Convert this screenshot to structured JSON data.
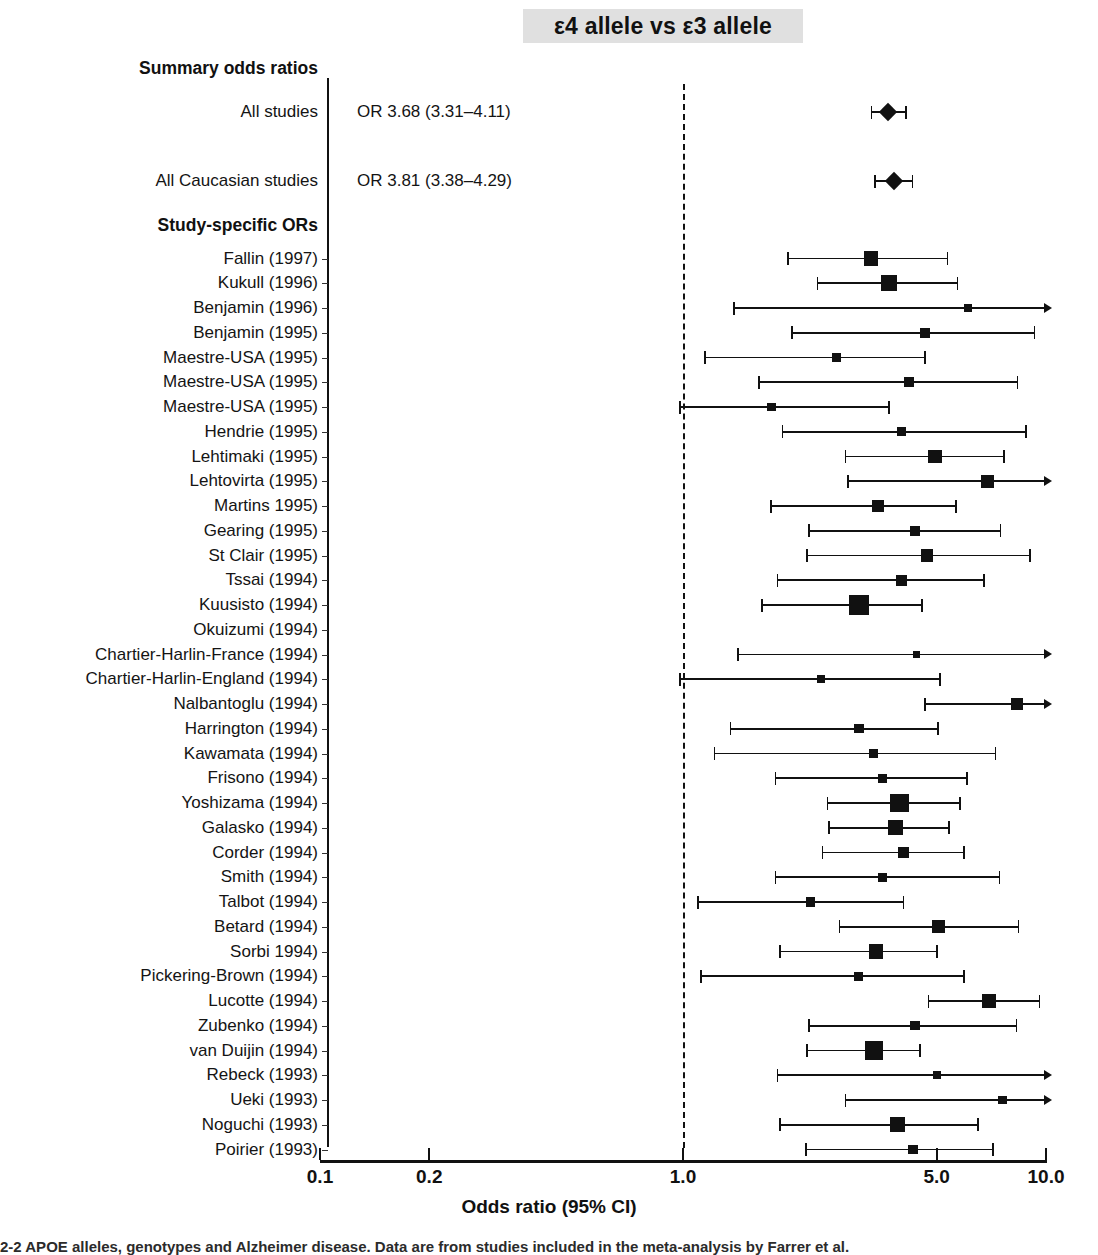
{
  "chart_data": {
    "type": "forest",
    "title": "ε4 allele vs ε3 allele",
    "xlabel": "Odds ratio (95% CI)",
    "ylabel": "",
    "xscale": "log",
    "xlim": [
      0.1,
      10.0
    ],
    "xticks": [
      "0.1",
      "0.2",
      "1.0",
      "5.0",
      "10.0"
    ],
    "xtick_values": [
      0.1,
      0.2,
      1.0,
      5.0,
      10.0
    ],
    "null_line": 1.0,
    "grid": false,
    "legend": "none",
    "sections": [
      {
        "heading": "Summary odds ratios",
        "marker": "diamond",
        "rows": [
          {
            "label": "All studies",
            "or_text": "OR 3.68 (3.31–4.11)",
            "or": 3.68,
            "lcl": 3.31,
            "ucl": 4.11,
            "weight": 1.0
          },
          {
            "label": "All Caucasian studies",
            "or_text": "OR 3.81 (3.38–4.29)",
            "or": 3.81,
            "lcl": 3.38,
            "ucl": 4.29,
            "weight": 1.0
          }
        ]
      },
      {
        "heading": "Study-specific ORs",
        "marker": "square",
        "rows": [
          {
            "label": "Fallin (1997)",
            "or": 3.3,
            "lcl": 1.95,
            "ucl": 5.35,
            "weight": 0.38
          },
          {
            "label": "Kukull (1996)",
            "or": 3.7,
            "lcl": 2.35,
            "ucl": 5.7,
            "weight": 0.52
          },
          {
            "label": "Benjamin (1996)",
            "or": 6.1,
            "lcl": 1.38,
            "ucl": 10.0,
            "weight": 0.07
          },
          {
            "label": "Benjamin (1995)",
            "or": 4.65,
            "lcl": 2.0,
            "ucl": 9.3,
            "weight": 0.14
          },
          {
            "label": "Maestre-USA (1995)",
            "or": 2.65,
            "lcl": 1.15,
            "ucl": 4.65,
            "weight": 0.13
          },
          {
            "label": "Maestre-USA (1995)",
            "or": 4.2,
            "lcl": 1.62,
            "ucl": 8.35,
            "weight": 0.16
          },
          {
            "label": "Maestre-USA (1995)",
            "or": 1.75,
            "lcl": 0.98,
            "ucl": 3.7,
            "weight": 0.11
          },
          {
            "label": "Hendrie (1995)",
            "or": 4.0,
            "lcl": 1.88,
            "ucl": 8.8,
            "weight": 0.1
          },
          {
            "label": "Lehtimaki (1995)",
            "or": 4.95,
            "lcl": 2.8,
            "ucl": 7.65,
            "weight": 0.34
          },
          {
            "label": "Lehtovirta (1995)",
            "or": 6.9,
            "lcl": 2.85,
            "ucl": 10.0,
            "weight": 0.3
          },
          {
            "label": "Martins 1995)",
            "or": 3.45,
            "lcl": 1.75,
            "ucl": 5.65,
            "weight": 0.27
          },
          {
            "label": "Gearing (1995)",
            "or": 4.35,
            "lcl": 2.22,
            "ucl": 7.5,
            "weight": 0.15
          },
          {
            "label": "St Clair (1995)",
            "or": 4.7,
            "lcl": 2.2,
            "ucl": 9.05,
            "weight": 0.26
          },
          {
            "label": "Tssai (1994)",
            "or": 4.0,
            "lcl": 1.82,
            "ucl": 6.75,
            "weight": 0.19
          },
          {
            "label": "Kuusisto (1994)",
            "or": 3.05,
            "lcl": 1.65,
            "ucl": 4.55,
            "weight": 0.95
          },
          {
            "label": "Okuizumi (1994)",
            "or": null,
            "lcl": null,
            "ucl": null,
            "weight": 0
          },
          {
            "label": "Chartier-Harlin-France (1994)",
            "or": 4.4,
            "lcl": 1.42,
            "ucl": 10.0,
            "weight": 0.07
          },
          {
            "label": "Chartier-Harlin-England (1994)",
            "or": 2.4,
            "lcl": 0.98,
            "ucl": 5.1,
            "weight": 0.09
          },
          {
            "label": "Nalbantoglu (1994)",
            "or": 8.3,
            "lcl": 4.65,
            "ucl": 10.0,
            "weight": 0.24
          },
          {
            "label": "Harrington (1994)",
            "or": 3.05,
            "lcl": 1.35,
            "ucl": 5.05,
            "weight": 0.13
          },
          {
            "label": "Kawamata (1994)",
            "or": 3.35,
            "lcl": 1.22,
            "ucl": 7.25,
            "weight": 0.1
          },
          {
            "label": "Frisono (1994)",
            "or": 3.55,
            "lcl": 1.8,
            "ucl": 6.05,
            "weight": 0.13
          },
          {
            "label": "Yoshizama (1994)",
            "or": 3.95,
            "lcl": 2.5,
            "ucl": 5.8,
            "weight": 0.72
          },
          {
            "label": "Galasko (1994)",
            "or": 3.85,
            "lcl": 2.52,
            "ucl": 5.4,
            "weight": 0.44
          },
          {
            "label": "Corder (1994)",
            "or": 4.05,
            "lcl": 2.42,
            "ucl": 5.95,
            "weight": 0.22
          },
          {
            "label": "Smith (1994)",
            "or": 3.55,
            "lcl": 1.8,
            "ucl": 7.45,
            "weight": 0.12
          },
          {
            "label": "Talbot (1994)",
            "or": 2.25,
            "lcl": 1.1,
            "ucl": 4.05,
            "weight": 0.12
          },
          {
            "label": "Betard (1994)",
            "or": 5.05,
            "lcl": 2.7,
            "ucl": 8.4,
            "weight": 0.32
          },
          {
            "label": "Sorbi 1994)",
            "or": 3.4,
            "lcl": 1.85,
            "ucl": 5.0,
            "weight": 0.38
          },
          {
            "label": "Pickering-Brown (1994)",
            "or": 3.05,
            "lcl": 1.12,
            "ucl": 5.95,
            "weight": 0.1
          },
          {
            "label": "Lucotte (1994)",
            "or": 6.95,
            "lcl": 4.75,
            "ucl": 9.6,
            "weight": 0.38
          },
          {
            "label": "Zubenko (1994)",
            "or": 4.35,
            "lcl": 2.22,
            "ucl": 8.3,
            "weight": 0.13
          },
          {
            "label": "van Duijin (1994)",
            "or": 3.35,
            "lcl": 2.2,
            "ucl": 4.5,
            "weight": 0.7
          },
          {
            "label": "Rebeck (1993)",
            "or": 5.0,
            "lcl": 1.82,
            "ucl": 10.0,
            "weight": 0.09
          },
          {
            "label": "Ueki (1993)",
            "or": 7.6,
            "lcl": 2.8,
            "ucl": 10.0,
            "weight": 0.1
          },
          {
            "label": "Noguchi (1993)",
            "or": 3.9,
            "lcl": 1.85,
            "ucl": 6.5,
            "weight": 0.42
          },
          {
            "label": "Poirier (1993)",
            "or": 4.3,
            "lcl": 2.18,
            "ucl": 7.15,
            "weight": 0.13
          }
        ]
      }
    ]
  },
  "colors": {
    "marker": "#111111",
    "axis": "#111111",
    "title_band": "#e0e0e0",
    "text": "#141414"
  },
  "caption": {
    "text": "2-2  APOE alleles, genotypes and Alzheimer disease. Data are from studies included in the meta-analysis by Farrer et al."
  }
}
